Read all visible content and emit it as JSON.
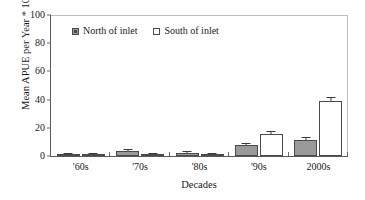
{
  "chart_data": {
    "type": "bar",
    "title": "",
    "subtitle": "",
    "xlabel": "Decades",
    "ylabel": "Mean APUE per Year * 100",
    "categories": [
      "'60s",
      "'70s",
      "'80s",
      "'90s",
      "2000s"
    ],
    "ylim": [
      0,
      100
    ],
    "yticks": [
      0,
      20,
      40,
      60,
      80,
      100
    ],
    "ytick_labels": [
      "0",
      "20",
      "40",
      "60",
      "80",
      "100"
    ],
    "grid": false,
    "legend_position": "top-center-inside",
    "series": [
      {
        "name": "North of inlet",
        "color": "#9a9a9a",
        "values": [
          0.8,
          3.4,
          2.3,
          7.5,
          11.2
        ],
        "errors": [
          0.4,
          0.9,
          0.7,
          1.3,
          1.5
        ]
      },
      {
        "name": "South of inlet",
        "color": "#ffffff",
        "values": [
          0.3,
          0.6,
          0.5,
          15.2,
          38.4
        ],
        "errors": [
          0.2,
          0.3,
          0.3,
          1.6,
          2.6
        ]
      }
    ]
  },
  "legend": {
    "items": [
      {
        "label": "North of inlet",
        "swatch": "filled-gray-square"
      },
      {
        "label": "South of inlet",
        "swatch": "open-white-square"
      }
    ]
  },
  "colors": {
    "north_fill": "#9a9a9a",
    "south_fill": "#ffffff",
    "bar_stroke": "#4a4a4a",
    "axis": "#5a5a5a",
    "text": "#1a1a1a",
    "background": "#ffffff"
  }
}
